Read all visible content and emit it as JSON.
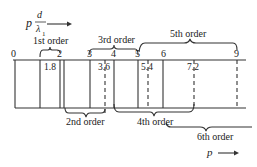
{
  "axis_top_label": {
    "var": "p",
    "numerator": "d",
    "denominator": "λ",
    "subscript": "1"
  },
  "axis_bottom_label": {
    "var": "p"
  },
  "ticks": [
    {
      "label": "0",
      "x": 15
    },
    {
      "label": "2",
      "x": 60
    },
    {
      "label": "3",
      "x": 90
    },
    {
      "label": "4",
      "x": 114
    },
    {
      "label": "5",
      "x": 138
    },
    {
      "label": "6",
      "x": 163
    },
    {
      "label": "9",
      "x": 237
    }
  ],
  "minor_ticks": [
    {
      "label": "1.8",
      "x": 53
    },
    {
      "label": "3.6",
      "x": 105
    },
    {
      "label": "5.4",
      "x": 148
    },
    {
      "label": "7.2",
      "x": 194
    }
  ],
  "orders": {
    "first": "1st order",
    "second": "2nd order",
    "third": "3rd order",
    "fourth": "4th order",
    "fifth": "5th order",
    "sixth": "6th order"
  }
}
